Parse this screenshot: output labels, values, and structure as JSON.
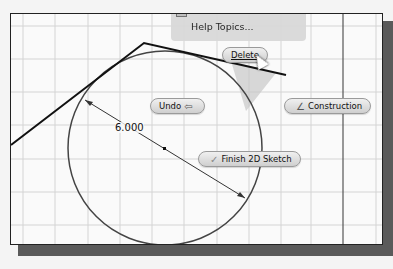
{
  "context_menu": {
    "items": [
      {
        "label": "Help Topics...",
        "icon": "help-icon"
      }
    ]
  },
  "marking_menu": {
    "delete_label": "Delete",
    "undo_label": "Undo",
    "undo_icon": "⇦",
    "construction_label": "Construction",
    "construction_icon": "∠",
    "finish_label": "Finish 2D Sketch",
    "finish_icon": "✓"
  },
  "sketch": {
    "dimension_value": "6.000",
    "circle": {
      "cx": 164,
      "cy": 147,
      "r": 97
    },
    "grid_color": "#d6d6d6",
    "line_color": "#111111"
  }
}
